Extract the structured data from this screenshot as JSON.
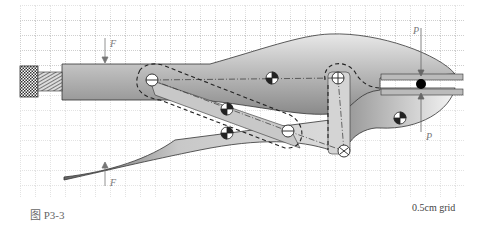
{
  "figure": {
    "caption": "图 P3-3",
    "grid_label": "0.5cm grid"
  },
  "labels": {
    "force_top": "F",
    "force_bottom": "F",
    "clamp_top": "P",
    "clamp_bottom": "P"
  },
  "colors": {
    "grid": "#9a9a9a",
    "body_light": "#f2f2f2",
    "body_dark": "#8a8a8a",
    "outline": "#333333"
  }
}
